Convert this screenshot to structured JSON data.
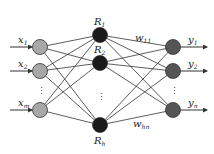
{
  "diagram": {
    "type": "neural-network",
    "layers": [
      {
        "name": "input",
        "color": "#a8a8a8",
        "nodes": [
          {
            "id": "x1",
            "base": "x",
            "sub": "1"
          },
          {
            "id": "x2",
            "base": "x",
            "sub": "2"
          },
          {
            "id": "xm",
            "base": "x",
            "sub": "m"
          }
        ],
        "ellipsis": "⋮"
      },
      {
        "name": "hidden",
        "color": "#1a1a1a",
        "nodes": [
          {
            "id": "R1",
            "base": "R",
            "sub": "1"
          },
          {
            "id": "R2",
            "base": "R",
            "sub": "2"
          },
          {
            "id": "Rh",
            "base": "R",
            "sub": "h"
          }
        ],
        "ellipsis": "⋮"
      },
      {
        "name": "output",
        "color": "#555555",
        "nodes": [
          {
            "id": "y1",
            "base": "y",
            "sub": "1"
          },
          {
            "id": "y2",
            "base": "y",
            "sub": "2"
          },
          {
            "id": "yn",
            "base": "y",
            "sub": "n"
          }
        ],
        "ellipsis": "⋮"
      }
    ],
    "weight_labels": [
      {
        "base": "w",
        "sub": "11"
      },
      {
        "base": "w",
        "sub": "hn"
      }
    ]
  }
}
